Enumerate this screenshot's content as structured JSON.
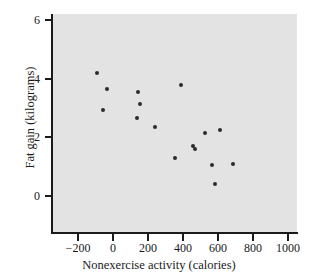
{
  "chart_data": {
    "type": "scatter",
    "title": "",
    "xlabel": "Nonexercise activity (calories)",
    "ylabel": "Fat gain (kilograms)",
    "xlim": [
      -350,
      1030
    ],
    "ylim": [
      -1.3,
      6.3
    ],
    "xticks": [
      -200,
      0,
      200,
      400,
      600,
      800,
      1000
    ],
    "yticks": [
      0,
      2,
      4,
      6
    ],
    "xticklabels": [
      "−200",
      "0",
      "200",
      "400",
      "600",
      "800",
      "1000"
    ],
    "yticklabels": [
      "0",
      "2",
      "4",
      "6"
    ],
    "grid": false,
    "legend": null,
    "marker_color": "#2b2b2b",
    "panel_color": "#e3e3e3",
    "points": [
      {
        "x": -94,
        "y": 4.2
      },
      {
        "x": -34,
        "y": 3.65
      },
      {
        "x": -57,
        "y": 2.95
      },
      {
        "x": 143,
        "y": 3.55
      },
      {
        "x": 154,
        "y": 3.15
      },
      {
        "x": 137,
        "y": 2.65
      },
      {
        "x": 240,
        "y": 2.35
      },
      {
        "x": 389,
        "y": 3.8
      },
      {
        "x": 354,
        "y": 1.3
      },
      {
        "x": 457,
        "y": 1.7
      },
      {
        "x": 471,
        "y": 1.6
      },
      {
        "x": 525,
        "y": 2.15
      },
      {
        "x": 611,
        "y": 2.25
      },
      {
        "x": 566,
        "y": 1.05
      },
      {
        "x": 580,
        "y": 0.4
      },
      {
        "x": 686,
        "y": 1.1
      }
    ]
  }
}
